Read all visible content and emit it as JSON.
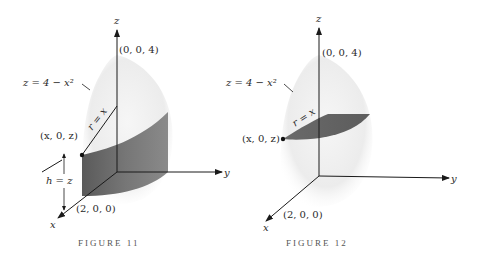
{
  "figures": [
    {
      "caption": "FIGURE 11",
      "labels": {
        "z_axis": "z",
        "y_axis": "y",
        "x_axis": "x",
        "apex": "(0, 0, 4)",
        "surface": "z = 4 − x²",
        "radius": "r = x",
        "point": "(x, 0, z)",
        "height": "h = z",
        "x_intercept": "(2, 0, 0)"
      },
      "shaded_region": "cylindrical shell"
    },
    {
      "caption": "FIGURE 12",
      "labels": {
        "z_axis": "z",
        "y_axis": "y",
        "x_axis": "x",
        "apex": "(0, 0, 4)",
        "surface": "z = 4 − x²",
        "radius": "r = x",
        "point": "(x, 0, z)",
        "x_intercept": "(2, 0, 0)"
      },
      "shaded_region": "horizontal disk slice"
    }
  ],
  "colors": {
    "dome": "#e9e9e9",
    "shaded": "#6b6b6b",
    "ink": "#1a1a1a"
  }
}
